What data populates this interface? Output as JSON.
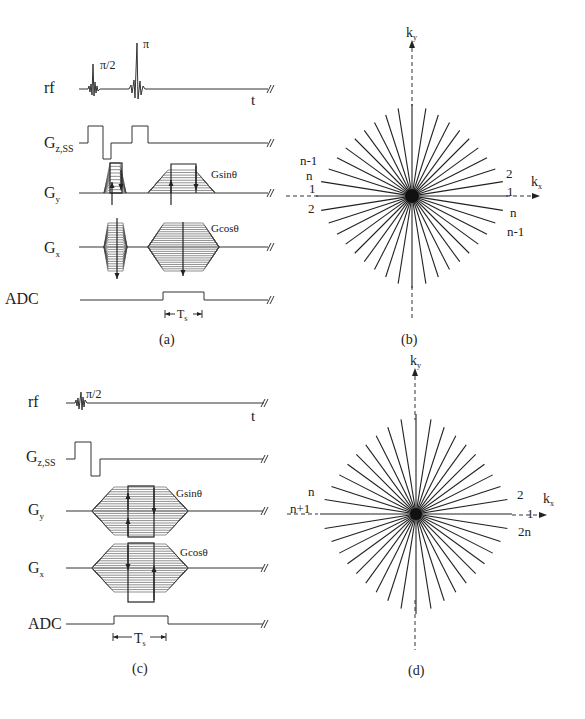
{
  "figure": {
    "panels": [
      {
        "id": "a",
        "caption": "(a)",
        "type": "pulse-sequence",
        "rows": [
          {
            "label": "rf",
            "sub": ""
          },
          {
            "label": "G",
            "sub": "z,SS"
          },
          {
            "label": "G",
            "sub": "y"
          },
          {
            "label": "G",
            "sub": "x"
          },
          {
            "label": "ADC",
            "sub": ""
          }
        ],
        "rf_labels": {
          "pulse1": "π/2",
          "pulse2": "π",
          "time_axis": "t"
        },
        "gy_annotation": "Gsinθ",
        "gx_annotation": "Gcosθ",
        "sampling_label": {
          "main": "T",
          "sub": "s"
        }
      },
      {
        "id": "b",
        "caption": "(b)",
        "type": "k-space-radial",
        "axes": {
          "x": {
            "main": "k",
            "sub": "x"
          },
          "y": {
            "main": "k",
            "sub": "y"
          }
        },
        "spoke_count": 20,
        "left_labels": [
          "n-1",
          "n",
          "1",
          "2"
        ],
        "right_labels": [
          "2",
          "1",
          "n",
          "n-1"
        ]
      },
      {
        "id": "c",
        "caption": "(c)",
        "type": "pulse-sequence",
        "rows": [
          {
            "label": "rf",
            "sub": ""
          },
          {
            "label": "G",
            "sub": "z,SS"
          },
          {
            "label": "G",
            "sub": "y"
          },
          {
            "label": "G",
            "sub": "x"
          },
          {
            "label": "ADC",
            "sub": ""
          }
        ],
        "rf_labels": {
          "pulse1": "π/2",
          "time_axis": "t"
        },
        "gy_annotation": "Gsinθ",
        "gx_annotation": "Gcosθ",
        "sampling_label": {
          "main": "T",
          "sub": "s"
        }
      },
      {
        "id": "d",
        "caption": "(d)",
        "type": "k-space-radial",
        "axes": {
          "x": {
            "main": "k",
            "sub": "x"
          },
          "y": {
            "main": "k",
            "sub": "y"
          }
        },
        "spoke_count": 20,
        "left_labels": [
          "n",
          "n+1"
        ],
        "right_labels": [
          "2",
          "1",
          "2n"
        ]
      }
    ]
  }
}
